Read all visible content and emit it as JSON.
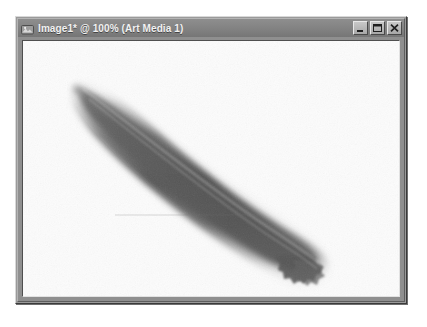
{
  "window": {
    "title": "Image1* @ 100% (Art Media 1)",
    "document_name": "Image1*",
    "zoom_level": "100%",
    "layer_name": "Art Media 1",
    "modified_indicator": "*",
    "icon_name": "image-document-icon",
    "title_bar_color": "#848484",
    "title_text_color": "#f2f2f2",
    "frame_color": "#9a9a9a"
  },
  "title_buttons": {
    "minimize": {
      "label": "Minimize",
      "icon": "minimize-icon"
    },
    "maximize": {
      "label": "Maximize",
      "icon": "maximize-icon"
    },
    "close": {
      "label": "Close",
      "icon": "close-icon"
    }
  },
  "canvas": {
    "background_color": "#fcfcfc",
    "artwork_name": "brush-stroke",
    "artwork_description": "Single broad diagonal art-media brush stroke running from upper-left to lower-right with a soft tapered tip, dark grey core and feathered translucent edges, ending in a ragged bristled tail.",
    "stroke_color_core": "#5a5a5a",
    "stroke_color_edge": "#b9b9b9"
  }
}
